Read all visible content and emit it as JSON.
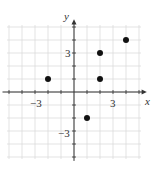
{
  "chart_data": {
    "type": "scatter",
    "title": "",
    "xlabel": "x",
    "ylabel": "y",
    "xlim": [
      -5,
      5
    ],
    "ylim": [
      -5,
      5
    ],
    "grid": true,
    "x_tick_labels": [
      {
        "value": -3,
        "label": "−3"
      },
      {
        "value": 3,
        "label": "3"
      }
    ],
    "y_tick_labels": [
      {
        "value": 3,
        "label": "3"
      },
      {
        "value": -3,
        "label": "−3"
      }
    ],
    "points": [
      {
        "x": -2,
        "y": 1
      },
      {
        "x": 2,
        "y": 3
      },
      {
        "x": 2,
        "y": 1
      },
      {
        "x": 4,
        "y": 4
      },
      {
        "x": 1,
        "y": -2
      }
    ]
  },
  "labels": {
    "x_axis": "x",
    "y_axis": "y",
    "x_neg3": "−3",
    "x_pos3": "3",
    "y_pos3": "3",
    "y_neg3": "−3"
  },
  "colors": {
    "grid": "#dcdcdc",
    "axis": "#333333",
    "point": "#111111"
  }
}
